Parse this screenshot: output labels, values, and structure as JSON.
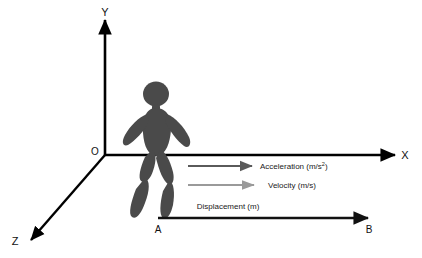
{
  "diagram": {
    "background_color": "#ffffff",
    "axes": {
      "origin_label": "O",
      "x_label": "X",
      "y_label": "Y",
      "z_label": "Z",
      "axis_color": "#000000"
    },
    "points": {
      "start_label": "A",
      "end_label": "B"
    },
    "figure": {
      "name": "walking-person",
      "color": "#4a4a4a"
    },
    "vectors": [
      {
        "name": "acceleration",
        "label": "Acceleration (m/s",
        "label_sup": "2",
        "label_tail": ")",
        "color": "#5a5a5a"
      },
      {
        "name": "velocity",
        "label": "Velocity (m/s)",
        "color": "#9a9a9a"
      },
      {
        "name": "displacement",
        "label": "Displacement (m)",
        "color": "#111111"
      }
    ]
  }
}
